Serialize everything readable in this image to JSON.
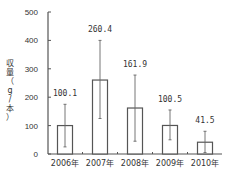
{
  "chart_data": {
    "type": "bar",
    "title": "",
    "xlabel": "",
    "ylabel": "収量（g/本）",
    "ylim": [
      0,
      500
    ],
    "yticks": [
      0,
      100,
      200,
      300,
      400,
      500
    ],
    "categories": [
      "2006年",
      "2007年",
      "2008年",
      "2009年",
      "2010年"
    ],
    "values": [
      100.1,
      260.4,
      161.9,
      100.5,
      41.5
    ],
    "value_labels": [
      "100.1",
      "260.4",
      "161.9",
      "100.5",
      "41.5"
    ],
    "error_bars": [
      {
        "low": 25,
        "high": 175
      },
      {
        "low": 125,
        "high": 400
      },
      {
        "low": 45,
        "high": 278
      },
      {
        "low": 50,
        "high": 155
      },
      {
        "low": 5,
        "high": 80
      }
    ],
    "grid": false,
    "legend": null,
    "bar_fill": "#ffffff",
    "bar_stroke": "#555555"
  },
  "yaxis_label_chars": [
    "収",
    "量",
    "（",
    "g",
    "/",
    "本",
    "）"
  ]
}
